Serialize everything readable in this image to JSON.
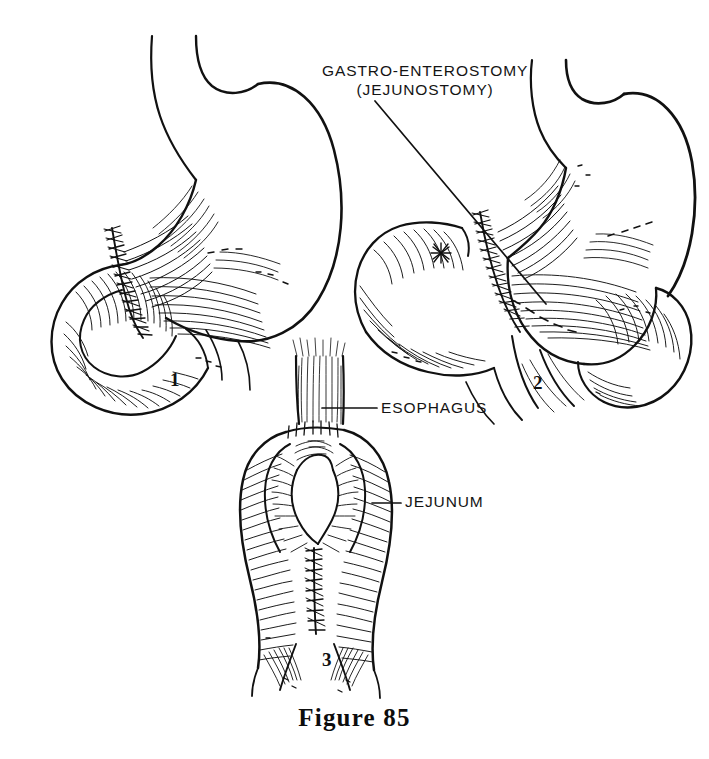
{
  "figure": {
    "caption": "Figure 85",
    "background_color": "#ffffff",
    "ink_color": "#111111",
    "style": "pen-and-ink surgical line drawing with hatching"
  },
  "labels": {
    "gastro_enterostomy_line1": "GASTRO-ENTEROSTOMY",
    "gastro_enterostomy_line2": "(JEJUNOSTOMY)",
    "esophagus": "ESOPHAGUS",
    "jejunum": "JEJUNUM"
  },
  "panels": [
    {
      "number": "1",
      "subject": "stomach with jejunal loop anastomosis, side view",
      "position": "upper-left"
    },
    {
      "number": "2",
      "subject": "stomach with gastro-enterostomy and efferent jejunal loops",
      "position": "upper-right"
    },
    {
      "number": "3",
      "subject": "esophagojejunostomy, esophagus sutured to jejunal loop",
      "position": "lower-center"
    }
  ],
  "leader_lines": [
    {
      "name": "gastro-enterostomy-leader",
      "from_label": "GASTRO-ENTEROSTOMY (JEJUNOSTOMY)",
      "points_to_panel": "2"
    },
    {
      "name": "esophagus-leader",
      "from_label": "ESOPHAGUS",
      "points_to_panel": "3"
    },
    {
      "name": "jejunum-leader",
      "from_label": "JEJUNUM",
      "points_to_panel": "3"
    }
  ]
}
